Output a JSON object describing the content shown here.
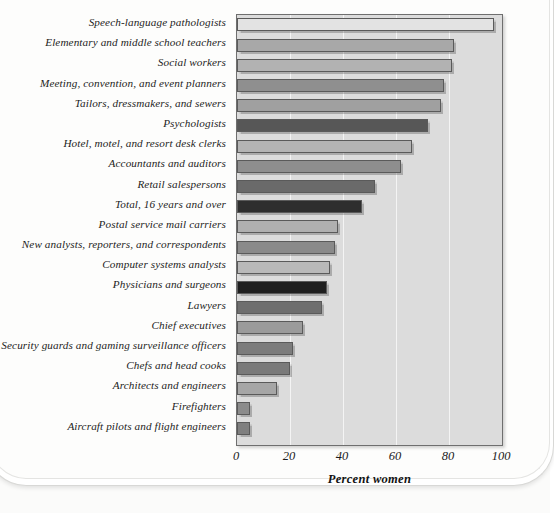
{
  "figure": {
    "background_color": "#fdfdfc",
    "plot_background_color": "#dcdcdc",
    "frame_color": "#6f6f6f"
  },
  "chart_data": {
    "type": "bar",
    "orientation": "horizontal",
    "title": "",
    "xlabel": "Percent women",
    "ylabel": "",
    "xlim": [
      0,
      100
    ],
    "xticks": [
      0,
      20,
      40,
      60,
      80,
      100
    ],
    "grid": true,
    "legend": "none",
    "categories": [
      "Speech-language pathologists",
      "Elementary and middle school teachers",
      "Social workers",
      "Meeting, convention, and event planners",
      "Tailors, dressmakers, and sewers",
      "Psychologists",
      "Hotel, motel, and resort desk clerks",
      "Accountants and auditors",
      "Retail salespersons",
      "Total, 16 years and over",
      "Postal service mail carriers",
      "New analysts, reporters, and correspondents",
      "Computer systems analysts",
      "Physicians and surgeons",
      "Lawyers",
      "Chief executives",
      "Security guards and gaming surveillance officers",
      "Chefs and head cooks",
      "Architects and engineers",
      "Firefighters",
      "Aircraft pilots and flight engineers"
    ],
    "values": [
      97,
      82,
      81,
      78,
      77,
      72,
      66,
      62,
      52,
      47,
      38,
      37,
      35,
      34,
      32,
      25,
      21,
      20,
      15,
      5,
      5
    ],
    "bar_colors": [
      "#e3e3e3",
      "#a8a8a8",
      "#b2b2b2",
      "#8f8f8f",
      "#a0a0a0",
      "#575757",
      "#b4b4b4",
      "#8e8e8e",
      "#6a6a6a",
      "#2e2e2e",
      "#b0b0b0",
      "#8a8a8a",
      "#b9b9b9",
      "#1f1f1f",
      "#6e6e6e",
      "#9b9b9b",
      "#7c7c7c",
      "#7a7a7a",
      "#a6a6a6",
      "#8b8b8b",
      "#7f7f7f"
    ]
  }
}
